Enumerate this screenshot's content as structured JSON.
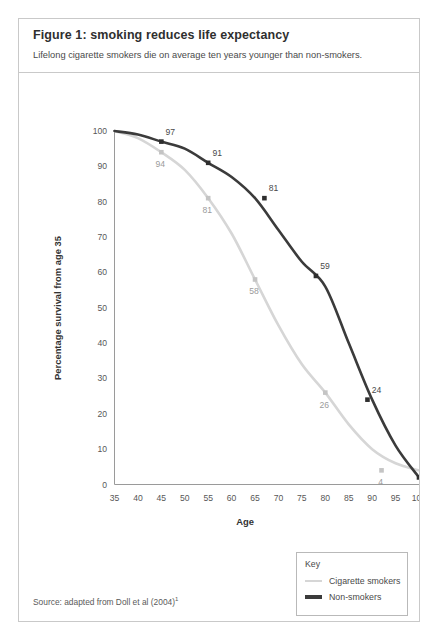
{
  "figure": {
    "title": "Figure 1: smoking reduces life expectancy",
    "subtitle": "Lifelong cigarette smokers die on average ten years younger than non-smokers.",
    "source": "Source: adapted from Doll et al (2004)",
    "source_superscript": "1"
  },
  "legend": {
    "title": "Key",
    "items": [
      {
        "label": "Cigarette smokers",
        "color": "#d6d6d6"
      },
      {
        "label": "Non-smokers",
        "color": "#3b3b3b"
      }
    ]
  },
  "chart_data": {
    "type": "line",
    "title": "Figure 1: smoking reduces life expectancy",
    "subtitle": "Lifelong cigarette smokers die on average ten years younger than non-smokers.",
    "xlabel": "Age",
    "ylabel": "Percentage survival from age 35",
    "xlim": [
      35,
      100
    ],
    "ylim": [
      0,
      100
    ],
    "xticks": [
      35,
      40,
      45,
      50,
      55,
      60,
      65,
      70,
      75,
      80,
      85,
      90,
      95,
      100
    ],
    "yticks": [
      0,
      10,
      20,
      30,
      40,
      50,
      60,
      70,
      80,
      90,
      100
    ],
    "grid": false,
    "legend_position": "bottom-right",
    "series": [
      {
        "name": "Cigarette smokers",
        "color": "#d6d6d6",
        "x": [
          35,
          40,
          45,
          50,
          55,
          60,
          65,
          70,
          75,
          80,
          85,
          90,
          95,
          100
        ],
        "y": [
          100,
          98,
          94,
          89,
          81,
          71,
          58,
          45,
          34,
          26,
          17,
          10,
          6,
          4
        ],
        "labeled_points": [
          {
            "x": 45,
            "y": 94,
            "label": "94"
          },
          {
            "x": 55,
            "y": 81,
            "label": "81"
          },
          {
            "x": 65,
            "y": 58,
            "label": "58"
          },
          {
            "x": 80,
            "y": 26,
            "label": "26"
          },
          {
            "x": 92,
            "y": 4,
            "label": "4"
          }
        ]
      },
      {
        "name": "Non-smokers",
        "color": "#3b3b3b",
        "x": [
          35,
          40,
          45,
          50,
          55,
          60,
          65,
          70,
          75,
          80,
          85,
          90,
          95,
          100
        ],
        "y": [
          100,
          99,
          97,
          95,
          91,
          87,
          81,
          72,
          63,
          56,
          40,
          24,
          11,
          2
        ],
        "labeled_points": [
          {
            "x": 45,
            "y": 97,
            "label": "97"
          },
          {
            "x": 55,
            "y": 91,
            "label": "91"
          },
          {
            "x": 67,
            "y": 81,
            "label": "81"
          },
          {
            "x": 78,
            "y": 59,
            "label": "59"
          },
          {
            "x": 89,
            "y": 24,
            "label": "24"
          },
          {
            "x": 100,
            "y": 2,
            "label": "2"
          }
        ]
      }
    ]
  }
}
